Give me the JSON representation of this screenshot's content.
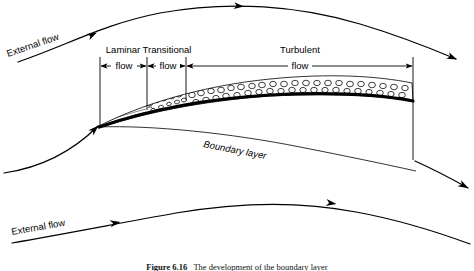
{
  "figure": {
    "caption_number": "Figure 6.16",
    "caption_text": "The development of the boundary layer",
    "background_color": "#ffffff",
    "line_color": "#000000"
  },
  "labels": {
    "external_flow_top": "External flow",
    "external_flow_bottom": "External flow",
    "boundary_layer": "Boundary layer",
    "laminar_line1": "Laminar",
    "laminar_line2": "flow",
    "transitional_line1": "Transitional",
    "transitional_line2": "flow",
    "turbulent_line1": "Turbulent",
    "turbulent_line2": "flow"
  },
  "regions": [
    {
      "name": "laminar",
      "label_line1": "Laminar",
      "label_line2": "flow",
      "x_start": 100,
      "x_end": 147,
      "label_x": 123,
      "dim_y": 66
    },
    {
      "name": "transitional",
      "label_line1": "Transitional",
      "label_line2": "flow",
      "x_start": 147,
      "x_end": 186,
      "label_x": 167,
      "dim_y": 66
    },
    {
      "name": "turbulent",
      "label_line1": "Turbulent",
      "label_line2": "flow",
      "x_start": 186,
      "x_end": 413,
      "label_x": 300,
      "dim_y": 66
    }
  ],
  "streamlines": [
    {
      "name": "top-external-streamline",
      "path": "M 18 62 C 70 44 105 24 160 13 C 230 0 300 6 360 24 C 400 36 430 48 458 60",
      "arrows": [
        {
          "x": 90,
          "y": 36,
          "angle": -24
        },
        {
          "x": 236,
          "y": 6,
          "angle": 4
        },
        {
          "x": 452,
          "y": 57,
          "angle": 26
        }
      ]
    },
    {
      "name": "leading-edge-streamline",
      "path": "M 6 172 C 40 166 72 152 99 125",
      "arrows": [
        {
          "x": 90,
          "y": 133,
          "angle": -41
        }
      ]
    },
    {
      "name": "trailing-streamline-upper",
      "path": "M 414 160 C 435 170 452 180 470 190",
      "arrows": [
        {
          "x": 462,
          "y": 185,
          "angle": 30
        }
      ]
    },
    {
      "name": "bottom-external-streamline",
      "path": "M 14 242 C 70 232 120 222 175 212 C 240 201 300 200 355 211 C 400 219 440 232 470 243",
      "arrows": [
        {
          "x": 112,
          "y": 224,
          "angle": -11
        },
        {
          "x": 326,
          "y": 203,
          "angle": 7
        },
        {
          "x": 466,
          "y": 241,
          "angle": 21
        }
      ]
    }
  ],
  "geometry": {
    "plate_surface_path": "M 99 126 C 140 112 200 98 270 94 C 330 91 375 93 412 99",
    "plate_under_path": "M 99 127 C 150 124 230 132 300 146 C 345 155 382 163 414 170",
    "bl_top_path": "M 99 126 C 140 105 200 86 270 79 C 330 73 378 76 412 83",
    "bl_end_x": 413,
    "right_tick_x": 413
  },
  "caption": {
    "prefix": "Figure 6.16",
    "body": "The development of the boundary layer"
  },
  "colors": {
    "stroke": "#000000",
    "background": "#ffffff",
    "text": "#000000"
  }
}
